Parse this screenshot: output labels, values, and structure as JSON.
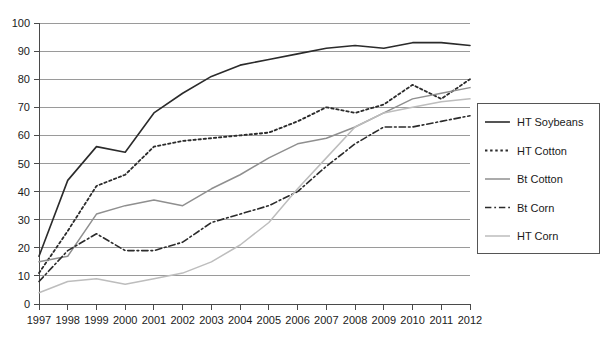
{
  "chart_data": {
    "type": "line",
    "title": "",
    "xlabel": "",
    "ylabel": "",
    "xlim": [
      1997,
      2012
    ],
    "ylim": [
      0,
      100
    ],
    "ytick_step": 10,
    "grid": true,
    "legend_position": "right",
    "x": [
      1997,
      1998,
      1999,
      2000,
      2001,
      2002,
      2003,
      2004,
      2005,
      2006,
      2007,
      2008,
      2009,
      2010,
      2011,
      2012
    ],
    "categories": [
      "1997",
      "1998",
      "1999",
      "2000",
      "2001",
      "2002",
      "2003",
      "2004",
      "2005",
      "2006",
      "2007",
      "2008",
      "2009",
      "2010",
      "2011",
      "2012"
    ],
    "yticks": [
      0,
      10,
      20,
      30,
      40,
      50,
      60,
      70,
      80,
      90,
      100
    ],
    "ytick_labels": [
      "0",
      "10",
      "20",
      "30",
      "40",
      "50",
      "60",
      "70",
      "80",
      "90",
      "100"
    ],
    "series": [
      {
        "name": "HT Soybeans",
        "style": "solid",
        "color": "#2b2b2b",
        "width": 1.6,
        "values": [
          17,
          44,
          56,
          54,
          68,
          75,
          81,
          85,
          87,
          89,
          91,
          92,
          91,
          93,
          93,
          92
        ]
      },
      {
        "name": "HT Cotton",
        "style": "dotted",
        "color": "#2b2b2b",
        "width": 1.8,
        "values": [
          11,
          26,
          42,
          46,
          56,
          58,
          59,
          60,
          61,
          65,
          70,
          68,
          71,
          78,
          73,
          80
        ]
      },
      {
        "name": "Bt Cotton",
        "style": "solid",
        "color": "#8f8f8f",
        "width": 1.5,
        "values": [
          15,
          17,
          32,
          35,
          37,
          35,
          41,
          46,
          52,
          57,
          59,
          63,
          68,
          73,
          75,
          77
        ]
      },
      {
        "name": "Bt Corn",
        "style": "dashdot",
        "color": "#2b2b2b",
        "width": 1.6,
        "values": [
          8,
          19,
          25,
          19,
          19,
          22,
          29,
          32,
          35,
          40,
          49,
          57,
          63,
          63,
          65,
          67
        ]
      },
      {
        "name": "HT Corn",
        "style": "solid",
        "color": "#bdbdbd",
        "width": 1.5,
        "values": [
          4,
          8,
          9,
          7,
          9,
          11,
          15,
          21,
          29,
          41,
          52,
          63,
          68,
          70,
          72,
          73
        ]
      }
    ]
  },
  "legend": {
    "items": [
      {
        "label": "HT Soybeans"
      },
      {
        "label": "HT Cotton"
      },
      {
        "label": "Bt Cotton"
      },
      {
        "label": "Bt Corn"
      },
      {
        "label": "HT Corn"
      }
    ]
  }
}
